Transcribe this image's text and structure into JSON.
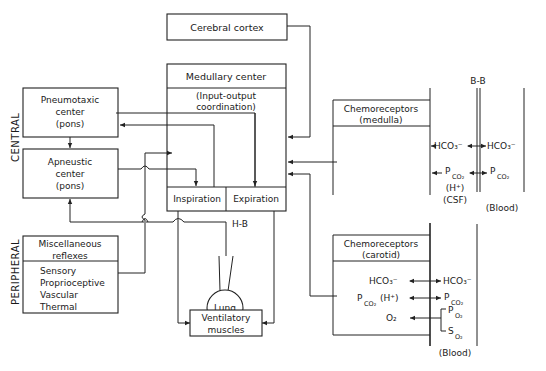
{
  "side_labels": {
    "central": "CENTRAL",
    "peripheral": "PERIPHERAL"
  },
  "boxes": {
    "cerebral_cortex": {
      "label": "Cerebral cortex"
    },
    "medullary_center": {
      "title": "Medullary center",
      "subtitle_line1": "(Input-output",
      "subtitle_line2": "coordination)",
      "inspiration": "Inspiration",
      "expiration": "Expiration"
    },
    "pneumotaxic": {
      "line1": "Pneumotaxic",
      "line2": "center",
      "line3": "(pons)"
    },
    "apneustic": {
      "line1": "Apneustic",
      "line2": "center",
      "line3": "(pons)"
    },
    "misc_reflexes": {
      "title1": "Miscellaneous",
      "title2": "reflexes",
      "items": [
        "Sensory",
        "Proprioceptive",
        "Vascular",
        "Thermal"
      ]
    },
    "lung": {
      "label": "Lung"
    },
    "ventilatory_muscles": {
      "line1": "Ventilatory",
      "line2": "muscles"
    },
    "chemo_medulla": {
      "line1": "Chemoreceptors",
      "line2": "(medulla)"
    },
    "chemo_carotid": {
      "line1": "Chemoreceptors",
      "line2": "(carotid)"
    }
  },
  "labels": {
    "hb": "H-B",
    "bb": "B-B",
    "hco3": "HCO₃⁻",
    "p": "P",
    "co2_sub": "CO₂",
    "o2_sub": "O₂",
    "h_plus": "(H⁺)",
    "csf": "(CSF)",
    "blood": "(Blood)",
    "o2": "O₂",
    "s": "S"
  }
}
